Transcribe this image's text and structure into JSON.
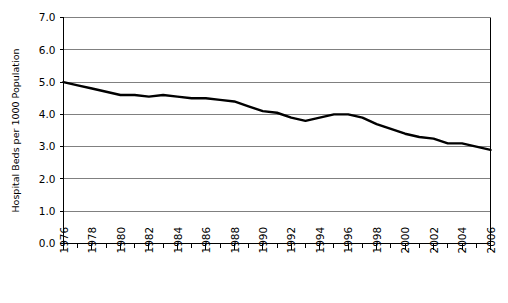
{
  "chart_data": {
    "type": "line",
    "title": "",
    "xlabel": "",
    "ylabel": "Hospital Beds per 1000 Population",
    "xlim": [
      1976,
      2006
    ],
    "ylim": [
      0.0,
      7.0
    ],
    "grid": true,
    "legend": "none",
    "y_ticks": [
      "0.0",
      "1.0",
      "2.0",
      "3.0",
      "4.0",
      "5.0",
      "6.0",
      "7.0"
    ],
    "y_tick_values": [
      0.0,
      1.0,
      2.0,
      3.0,
      4.0,
      5.0,
      6.0,
      7.0
    ],
    "x_ticks": [
      "1976",
      "1978",
      "1980",
      "1982",
      "1984",
      "1986",
      "1988",
      "1990",
      "1992",
      "1994",
      "1996",
      "1998",
      "2000",
      "2002",
      "2004",
      "2006"
    ],
    "x_tick_values": [
      1976,
      1978,
      1980,
      1982,
      1984,
      1986,
      1988,
      1990,
      1992,
      1994,
      1996,
      1998,
      2000,
      2002,
      2004,
      2006
    ],
    "x_minor_tick_values": [
      1977,
      1979,
      1981,
      1983,
      1985,
      1987,
      1989,
      1991,
      1993,
      1995,
      1997,
      1999,
      2001,
      2003,
      2005
    ],
    "series": [
      {
        "name": "Hospital beds per 1000 population",
        "color": "#000000",
        "line_width": 2.4,
        "x": [
          1976,
          1977,
          1978,
          1979,
          1980,
          1981,
          1982,
          1983,
          1984,
          1985,
          1986,
          1987,
          1988,
          1989,
          1990,
          1991,
          1992,
          1993,
          1994,
          1995,
          1996,
          1997,
          1998,
          1999,
          2000,
          2001,
          2002,
          2003,
          2004,
          2005,
          2006
        ],
        "values": [
          5.0,
          4.9,
          4.8,
          4.7,
          4.6,
          4.6,
          4.55,
          4.6,
          4.55,
          4.5,
          4.5,
          4.45,
          4.4,
          4.25,
          4.1,
          4.05,
          3.9,
          3.8,
          3.9,
          4.0,
          4.0,
          3.9,
          3.7,
          3.55,
          3.4,
          3.3,
          3.25,
          3.1,
          3.1,
          3.0,
          2.9
        ]
      }
    ]
  }
}
